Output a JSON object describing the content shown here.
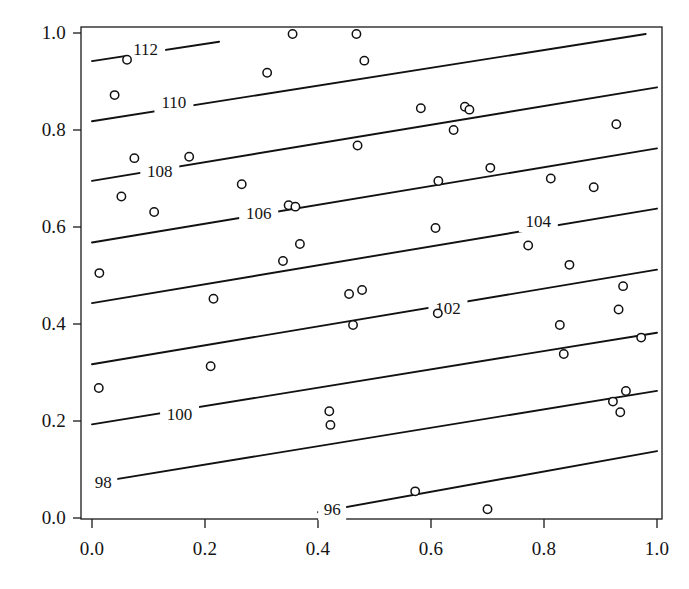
{
  "chart_data": {
    "type": "line",
    "title": "",
    "subtitle": "",
    "xlabel": "",
    "ylabel": "",
    "xlim": [
      0.0,
      1.0
    ],
    "ylim": [
      0.0,
      1.0
    ],
    "grid": false,
    "legend": "none",
    "xticks": [
      "0.0",
      "0.2",
      "0.4",
      "0.6",
      "0.8",
      "1.0"
    ],
    "xtick_values": [
      0.0,
      0.2,
      0.4,
      0.6,
      0.8,
      1.0
    ],
    "yticks": [
      "0.0",
      "0.2",
      "0.4",
      "0.6",
      "0.8",
      "1.0"
    ],
    "ytick_values": [
      0.0,
      0.2,
      0.4,
      0.6,
      0.8,
      1.0
    ],
    "marker": "open-circle",
    "marker_radius_px": 4.2,
    "line_color": "#111111",
    "marker_color": "#111111",
    "contour_labels": [
      "96",
      "98",
      "100",
      "102",
      "104",
      "106",
      "108",
      "110",
      "112"
    ],
    "contour_label_positions": [
      {
        "label": "96",
        "x": 0.425,
        "y": 0.018
      },
      {
        "label": "98",
        "x": 0.02,
        "y": 0.075
      },
      {
        "label": "100",
        "x": 0.155,
        "y": 0.215
      },
      {
        "label": "102",
        "x": 0.63,
        "y": 0.432
      },
      {
        "label": "104",
        "x": 0.79,
        "y": 0.612
      },
      {
        "label": "106",
        "x": 0.295,
        "y": 0.628
      },
      {
        "label": "108",
        "x": 0.12,
        "y": 0.715
      },
      {
        "label": "110",
        "x": 0.145,
        "y": 0.858
      },
      {
        "label": "112",
        "x": 0.095,
        "y": 0.968
      }
    ],
    "contours": [
      {
        "level": 96,
        "x0": 0.4,
        "y0": 0.012,
        "x1": 1.0,
        "y1": 0.138
      },
      {
        "level": 98,
        "x0": 0.0,
        "y0": 0.072,
        "x1": 1.0,
        "y1": 0.262
      },
      {
        "level": 100,
        "x0": 0.0,
        "y0": 0.193,
        "x1": 1.0,
        "y1": 0.382
      },
      {
        "level": 102,
        "x0": 0.0,
        "y0": 0.317,
        "x1": 1.0,
        "y1": 0.512
      },
      {
        "level": 104,
        "x0": 0.0,
        "y0": 0.443,
        "x1": 1.0,
        "y1": 0.638
      },
      {
        "level": 106,
        "x0": 0.0,
        "y0": 0.568,
        "x1": 1.0,
        "y1": 0.762
      },
      {
        "level": 108,
        "x0": 0.0,
        "y0": 0.695,
        "x1": 1.0,
        "y1": 0.888
      },
      {
        "level": 110,
        "x0": 0.0,
        "y0": 0.818,
        "x1": 0.98,
        "y1": 0.998
      },
      {
        "level": 112,
        "x0": 0.0,
        "y0": 0.942,
        "x1": 0.225,
        "y1": 0.982
      }
    ],
    "points": [
      {
        "x": 0.012,
        "y": 0.268
      },
      {
        "x": 0.013,
        "y": 0.505
      },
      {
        "x": 0.04,
        "y": 0.872
      },
      {
        "x": 0.052,
        "y": 0.663
      },
      {
        "x": 0.062,
        "y": 0.945
      },
      {
        "x": 0.075,
        "y": 0.742
      },
      {
        "x": 0.11,
        "y": 0.631
      },
      {
        "x": 0.172,
        "y": 0.745
      },
      {
        "x": 0.21,
        "y": 0.313
      },
      {
        "x": 0.215,
        "y": 0.452
      },
      {
        "x": 0.265,
        "y": 0.688
      },
      {
        "x": 0.31,
        "y": 0.918
      },
      {
        "x": 0.338,
        "y": 0.53
      },
      {
        "x": 0.348,
        "y": 0.645
      },
      {
        "x": 0.355,
        "y": 0.998
      },
      {
        "x": 0.36,
        "y": 0.642
      },
      {
        "x": 0.368,
        "y": 0.565
      },
      {
        "x": 0.42,
        "y": 0.22
      },
      {
        "x": 0.422,
        "y": 0.192
      },
      {
        "x": 0.455,
        "y": 0.462
      },
      {
        "x": 0.462,
        "y": 0.398
      },
      {
        "x": 0.468,
        "y": 0.998
      },
      {
        "x": 0.47,
        "y": 0.768
      },
      {
        "x": 0.478,
        "y": 0.47
      },
      {
        "x": 0.482,
        "y": 0.943
      },
      {
        "x": 0.572,
        "y": 0.055
      },
      {
        "x": 0.582,
        "y": 0.845
      },
      {
        "x": 0.608,
        "y": 0.598
      },
      {
        "x": 0.612,
        "y": 0.422
      },
      {
        "x": 0.613,
        "y": 0.695
      },
      {
        "x": 0.64,
        "y": 0.8
      },
      {
        "x": 0.66,
        "y": 0.848
      },
      {
        "x": 0.668,
        "y": 0.842
      },
      {
        "x": 0.7,
        "y": 0.018
      },
      {
        "x": 0.705,
        "y": 0.722
      },
      {
        "x": 0.772,
        "y": 0.562
      },
      {
        "x": 0.812,
        "y": 0.7
      },
      {
        "x": 0.828,
        "y": 0.398
      },
      {
        "x": 0.835,
        "y": 0.338
      },
      {
        "x": 0.845,
        "y": 0.522
      },
      {
        "x": 0.888,
        "y": 0.682
      },
      {
        "x": 0.922,
        "y": 0.24
      },
      {
        "x": 0.928,
        "y": 0.812
      },
      {
        "x": 0.932,
        "y": 0.43
      },
      {
        "x": 0.935,
        "y": 0.218
      },
      {
        "x": 0.94,
        "y": 0.478
      },
      {
        "x": 0.945,
        "y": 0.262
      },
      {
        "x": 0.972,
        "y": 0.372
      }
    ]
  },
  "axes": {
    "frame_color": "#1a1a1a",
    "tick_color": "#1a1a1a"
  }
}
